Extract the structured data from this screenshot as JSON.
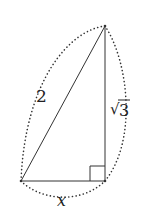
{
  "figure": {
    "type": "right-triangle",
    "colors": {
      "stroke": "#333333",
      "dots": "#333333",
      "background": "#ffffff"
    },
    "vertices": {
      "top": [
        105,
        26
      ],
      "bottom_left": [
        21,
        181
      ],
      "bottom_right": [
        105,
        181
      ]
    },
    "right_angle_at": "bottom_right",
    "labels": {
      "hypotenuse": "2",
      "vertical_leg_radical": "√",
      "vertical_leg_value": "3",
      "horizontal_leg": "x"
    }
  }
}
